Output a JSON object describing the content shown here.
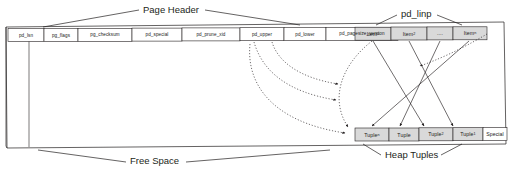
{
  "diagram": {
    "title_labels": {
      "page_header": "Page Header",
      "pd_linp": "pd_linp",
      "free_space": "Free Space",
      "heap_tuples": "Heap Tuples"
    },
    "colors": {
      "stroke": "#231f20",
      "cell_fill_header": "#ffffff",
      "cell_fill_item": "#d9d9d9",
      "cell_fill_tuple": "#d9d9d9",
      "cell_fill_special": "#ffffff",
      "page_background": "#ffffff",
      "dotted_arrow": "#231f20",
      "solid_arrow": "#231f20"
    },
    "page_header_fields": [
      {
        "label": "pd_lsn",
        "x": 8,
        "w": 36
      },
      {
        "label": "pg_flags",
        "x": 44,
        "w": 34
      },
      {
        "label": "pg_checksum",
        "x": 78,
        "w": 54
      },
      {
        "label": "pd_special",
        "x": 132,
        "w": 50
      },
      {
        "label": "pd_prune_xid",
        "x": 182,
        "w": 58
      },
      {
        "label": "pd_upper",
        "x": 240,
        "w": 44
      },
      {
        "label": "pd_lower",
        "x": 284,
        "w": 42
      },
      {
        "label": "pd_pagesize_version",
        "x": 326,
        "w": 72
      }
    ],
    "item_pointers": [
      {
        "label": "Item",
        "sub": "1",
        "x": 355,
        "w": 36
      },
      {
        "label": "Item",
        "sub": "2",
        "x": 391,
        "w": 36
      },
      {
        "label": "....",
        "sub": "",
        "x": 427,
        "w": 26
      },
      {
        "label": "Item",
        "sub": "n",
        "x": 453,
        "w": 34
      }
    ],
    "heap_tuples": [
      {
        "label": "Tuple",
        "sub": "n",
        "x": 355,
        "w": 34
      },
      {
        "label": "Tuple",
        "sub": "",
        "x": 389,
        "w": 30
      },
      {
        "label": "Tuple",
        "sub": "2",
        "x": 419,
        "w": 34
      },
      {
        "label": "Tuple",
        "sub": "1",
        "x": 453,
        "w": 30
      }
    ],
    "special_section": {
      "label": "Special",
      "x": 483,
      "w": 24
    }
  }
}
